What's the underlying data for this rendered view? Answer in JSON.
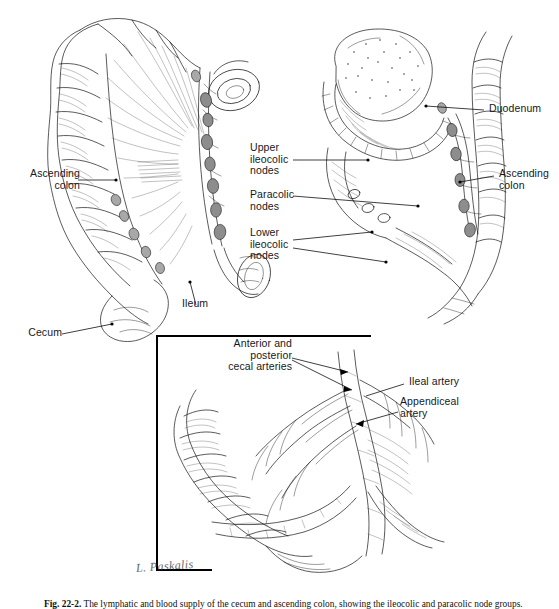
{
  "figure": {
    "caption_number": "Fig. 22-2.",
    "caption_text": "The lymphatic and blood supply of the cecum and ascending colon, showing the ileocolic and paracolic node groups.",
    "signature": "L. Paskalis"
  },
  "labels": {
    "ascending_colon_left": "Ascending\ncolon",
    "cecum": "Cecum",
    "ileum": "Ileum",
    "upper_ileocolic_nodes": "Upper\nileocolic\nnodes",
    "paracolic_nodes": "Paracolic\nnodes",
    "lower_ileocolic_nodes": "Lower\nileocolic\nnodes",
    "duodenum": "Duodenum",
    "ascending_colon_right": "Ascending\ncolon",
    "cecal_arteries": "Anterior and\nposterior\ncecal arteries",
    "ileal_artery": "Ileal artery",
    "appendiceal_artery": "Appendiceal\nartery"
  },
  "panels": {
    "left": "Anterior view of cecum and ascending colon with mesenteric lymphatics",
    "right": "Posterior view showing duodenum and pancreatic head behind the colon",
    "inset": "Magnified view of cecal arterial supply"
  },
  "colors": {
    "ink": "#1b1b1b",
    "node_fill": "#8d8d8d",
    "background": "#ffffff",
    "frame": "#000000"
  }
}
